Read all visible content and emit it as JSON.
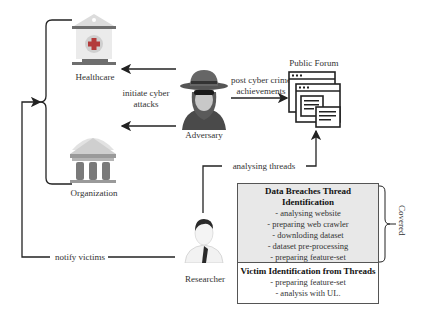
{
  "nodes": {
    "healthcare": {
      "label": "Healthcare",
      "icon": "hospital-icon"
    },
    "organization": {
      "label": "Organization",
      "icon": "bank-building-icon"
    },
    "adversary": {
      "label": "Adversary",
      "icon": "hacker-icon"
    },
    "public_forum": {
      "label": "Public Forum",
      "icon": "forum-windows-icon"
    },
    "researcher": {
      "label": "Researcher",
      "icon": "researcher-icon"
    }
  },
  "edges": {
    "initiate_attacks": {
      "line1": "initiate cyber",
      "line2": "attacks"
    },
    "post_achievements": {
      "line1": "post cyber crime",
      "line2": "achievements"
    },
    "analysing_threads": {
      "label": "analysing threads"
    },
    "notify_victims": {
      "label": "notify victims"
    }
  },
  "boxes": {
    "data_breaches": {
      "title": "Data Breaches Thread Identification",
      "items": [
        "- analysing website",
        "- preparing web crawler",
        "- downloding dataset",
        "- dataset pre-processing",
        "- preparing feature-set",
        "- analysis with SL"
      ]
    },
    "victim_identification": {
      "title": "Victim Identification from Threads",
      "items": [
        "- preparing feature-set",
        "- analysis with UL."
      ]
    }
  },
  "annotations": {
    "covered": "Covered"
  },
  "colors": {
    "line": "#222222",
    "box_fill": "#e8e8e8",
    "icon_gray": "#8a8a8a",
    "icon_red": "#b33a3a"
  }
}
